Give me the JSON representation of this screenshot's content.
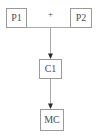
{
  "diagram": {
    "operator": "+",
    "nodes": {
      "p1": {
        "label": "P1"
      },
      "p2": {
        "label": "P2"
      },
      "c1": {
        "label": "C1"
      },
      "mc": {
        "label": "MC"
      }
    },
    "edges": [
      {
        "from": "P1",
        "to": "C1",
        "via": "+"
      },
      {
        "from": "P2",
        "to": "C1",
        "via": "+"
      },
      {
        "from": "C1",
        "to": "MC"
      }
    ],
    "colors": {
      "background": "#ffffff",
      "line": "#a8a8a8",
      "border": "#9a9a9a",
      "text": "#4d4d4d",
      "arrow": "#2b2b2b"
    }
  }
}
